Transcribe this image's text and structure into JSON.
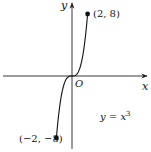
{
  "chart_data": {
    "type": "line",
    "title": "",
    "xlabel": "x",
    "ylabel": "y",
    "origin_label": "O",
    "equation": {
      "lhs": "y = x",
      "exponent": "3",
      "full": "y = x^3"
    },
    "function": "x^3",
    "domain": [
      -2,
      2
    ],
    "range": [
      -8,
      8
    ],
    "series": [
      {
        "name": "y = x^3",
        "x": [
          -2,
          -1.5,
          -1,
          -0.5,
          0,
          0.5,
          1,
          1.5,
          2
        ],
        "y": [
          -8,
          -3.375,
          -1,
          -0.125,
          0,
          0.125,
          1,
          3.375,
          8
        ]
      }
    ],
    "endpoints": [
      {
        "x": 2,
        "y": 8,
        "label": "(2, 8)"
      },
      {
        "x": -2,
        "y": -8,
        "label": "(−2, −8)"
      }
    ],
    "grid": false,
    "ticks": false,
    "legend": "none"
  },
  "colors": {
    "ink": "#111111",
    "axis": "#222222",
    "background": "#ffffff"
  }
}
